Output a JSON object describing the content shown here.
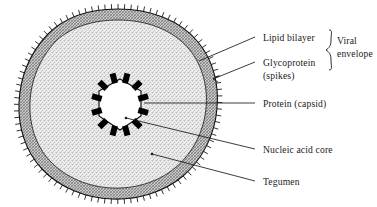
{
  "figure": {
    "background_color": "#ffffff",
    "ink_color": "#1a1a1a"
  },
  "labels": {
    "lipid_bilayer": "Lipid bilayer",
    "glycoprotein": "Glycoprotein",
    "glycoprotein_second_line": "(spikes)",
    "viral_envelope_line1": "Viral",
    "viral_envelope_line2": "envelope",
    "protein_capsid": "Protein (capsid)",
    "nucleic_acid_core": "Nucleic acid core",
    "tegumen": "Tegumen"
  },
  "structure": {
    "envelope_band_color": "#b9b9b9",
    "core_fill_color": "#e4e4e4",
    "capsid_fill_color": "#ffffff",
    "capsid_block_color": "#000000",
    "spike_count": 96,
    "capsid_block_count": 12,
    "capsid_shape": "hexagon"
  }
}
